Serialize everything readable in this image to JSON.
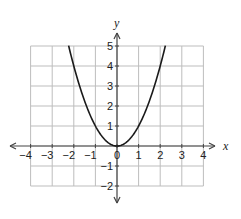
{
  "chart_data": {
    "type": "line",
    "title": "",
    "xlabel": "x",
    "ylabel": "y",
    "xlim": [
      -4,
      4
    ],
    "ylim": [
      -2,
      5
    ],
    "grid": true,
    "x_ticks": [
      "-4",
      "-3",
      "-2",
      "-1",
      "0",
      "1",
      "2",
      "3",
      "4"
    ],
    "y_ticks": [
      "-2",
      "-1",
      "1",
      "2",
      "3",
      "4",
      "5"
    ],
    "series": [
      {
        "name": "y = x^2",
        "x": [
          -2.24,
          -2,
          -1.5,
          -1,
          -0.5,
          0,
          0.5,
          1,
          1.5,
          2,
          2.24
        ],
        "y": [
          5,
          4,
          2.25,
          1,
          0.25,
          0,
          0.25,
          1,
          2.25,
          4,
          5
        ]
      }
    ],
    "colors": {
      "curve": "#1a1a1a",
      "grid": "#bdbdbd",
      "axis": "#444444"
    }
  }
}
